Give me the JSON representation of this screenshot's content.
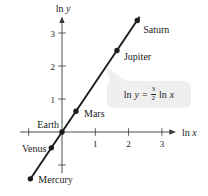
{
  "figure": {
    "background": "#ffffff",
    "ink_color": "#1c1c1c",
    "axis_color": "#3a3a3a",
    "annotation_bg": "#efefef"
  },
  "chart_data": {
    "type": "scatter",
    "title": "",
    "xlabel": {
      "prefix": "ln",
      "variable": "x"
    },
    "ylabel": {
      "prefix": "ln",
      "variable": "y"
    },
    "equation": {
      "lhs_prefix": "ln",
      "lhs_variable": "y",
      "equals": "=",
      "fraction_numerator": "3",
      "fraction_denominator": "2",
      "rhs_prefix": "ln",
      "rhs_variable": "x"
    },
    "line": {
      "slope": 1.5,
      "intercept": 0,
      "x_start": -0.97,
      "x_end": 2.33
    },
    "points": [
      {
        "label": "Mercury",
        "x": -0.95,
        "y": -1.42,
        "label_anchor": "start",
        "label_dx": 8,
        "label_dy": 4
      },
      {
        "label": "Venus",
        "x": -0.32,
        "y": -0.48,
        "label_anchor": "end",
        "label_dx": -5,
        "label_dy": 4
      },
      {
        "label": "Earth",
        "x": 0,
        "y": 0,
        "label_anchor": "end",
        "label_dx": -3,
        "label_dy": -4
      },
      {
        "label": "Mars",
        "x": 0.42,
        "y": 0.63,
        "label_anchor": "start",
        "label_dx": 8,
        "label_dy": 6
      },
      {
        "label": "Jupiter",
        "x": 1.65,
        "y": 2.47,
        "label_anchor": "start",
        "label_dx": 7,
        "label_dy": 10
      },
      {
        "label": "Saturn",
        "x": 2.26,
        "y": 3.38,
        "label_anchor": "start",
        "label_dx": 6,
        "label_dy": 13
      }
    ],
    "x_ticks_labeled": [
      1,
      2,
      3
    ],
    "x_ticks_unlabeled": [
      -1
    ],
    "y_ticks_labeled": [
      1,
      2,
      3
    ],
    "y_ticks_unlabeled": [
      -1
    ],
    "xlim": [
      -1.26,
      3.42
    ],
    "ylim": [
      -1.25,
      3.5
    ],
    "grid": false,
    "legend": null
  }
}
